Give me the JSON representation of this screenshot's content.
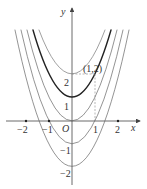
{
  "figure": {
    "axes": {
      "x_label": "x",
      "y_label": "y",
      "origin_label": "O",
      "x_ticks": [
        {
          "value": -2,
          "label": "−2"
        },
        {
          "value": -1,
          "label": "−1"
        },
        {
          "value": 1,
          "label": "1"
        },
        {
          "value": 2,
          "label": "2"
        }
      ],
      "y_ticks": [
        {
          "value": 2,
          "label": "2"
        },
        {
          "value": 1,
          "label": "1"
        },
        {
          "value": -1,
          "label": "−1"
        },
        {
          "value": -2,
          "label": "−2"
        }
      ]
    },
    "curves": [
      {
        "name": "parabola-vertex-2",
        "vertex": [
          0,
          2
        ],
        "style": "thin"
      },
      {
        "name": "parabola-vertex-1",
        "vertex": [
          0,
          1
        ],
        "style": "bold"
      },
      {
        "name": "parabola-vertex-0",
        "vertex": [
          0,
          0
        ],
        "style": "thin"
      },
      {
        "name": "parabola-vertex-neg1",
        "vertex": [
          0,
          -1
        ],
        "style": "thin"
      },
      {
        "name": "parabola-vertex-neg2",
        "vertex": [
          0,
          -2
        ],
        "style": "thin"
      }
    ],
    "point": {
      "label": "(1,2)",
      "x": 1,
      "y": 2
    },
    "colors": {
      "curve": "#555555",
      "bold_curve": "#222222",
      "axis": "#444444",
      "dashed": "#888888"
    }
  }
}
